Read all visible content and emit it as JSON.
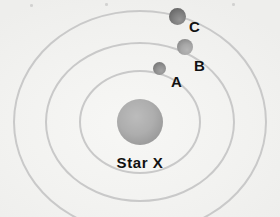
{
  "diagram": {
    "title_visible": false,
    "background_color": "#f4f4f2",
    "star": {
      "name": "star-x",
      "label": "Star X",
      "color": "#a9a9a9",
      "center_x": 140,
      "center_y": 122,
      "radius": 23,
      "label_x": 140,
      "label_y": 155
    },
    "orbits": [
      {
        "name": "orbit-inner",
        "rx": 61,
        "ry": 52,
        "color": "#c9c9c9",
        "stroke_width": 2
      },
      {
        "name": "orbit-middle",
        "rx": 95,
        "ry": 80,
        "color": "#c9c9c9",
        "stroke_width": 2
      },
      {
        "name": "orbit-outer",
        "rx": 127,
        "ry": 112,
        "color": "#c9c9c9",
        "stroke_width": 2
      }
    ],
    "planets": [
      {
        "id": "A",
        "label": "A",
        "color": "#8c8c8c",
        "center_x": 159,
        "center_y": 68,
        "radius": 6.5,
        "orbit": "orbit-inner",
        "label_x": 171,
        "label_y": 74
      },
      {
        "id": "B",
        "label": "B",
        "color": "#a3a3a3",
        "center_x": 185,
        "center_y": 47,
        "radius": 8,
        "orbit": "orbit-middle",
        "label_x": 194,
        "label_y": 58
      },
      {
        "id": "C",
        "label": "C",
        "color": "#7a7a7a",
        "center_x": 177,
        "center_y": 16,
        "radius": 8.5,
        "orbit": "orbit-outer",
        "label_x": 189,
        "label_y": 19
      }
    ],
    "specks": [
      {
        "x": 30,
        "y": 4
      },
      {
        "x": 105,
        "y": 3
      },
      {
        "x": 232,
        "y": 3
      },
      {
        "x": 176,
        "y": 9
      }
    ]
  }
}
